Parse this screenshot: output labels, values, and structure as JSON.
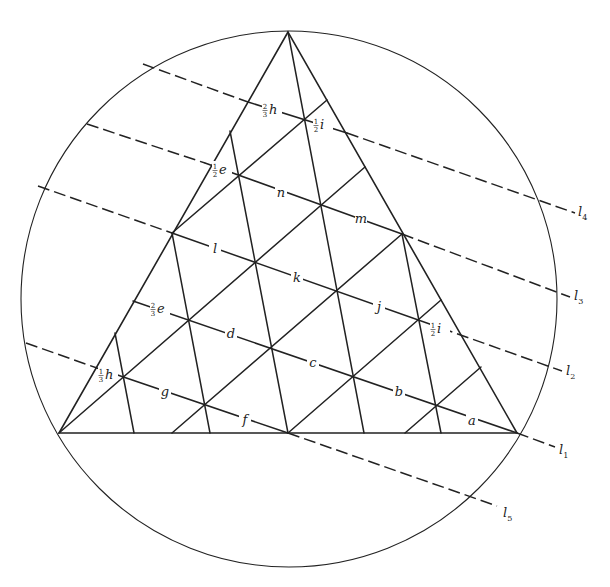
{
  "figure": {
    "stroke_color": "#222222",
    "background": "#ffffff",
    "circle": {
      "cx": 289,
      "cy": 299,
      "r": 268
    },
    "triangle": {
      "vertices": [
        [
          288,
          32
        ],
        [
          59,
          433
        ],
        [
          517,
          433
        ]
      ]
    },
    "parallel_lines": [
      {
        "name": "l4",
        "label": "l",
        "subscript": "4",
        "label_pos": [
          578,
          216
        ],
        "dashed": [
          [
            [
              143,
              64
            ],
            [
              248,
              102
            ]
          ],
          [
            [
              347,
              133
            ],
            [
              575,
              213
            ]
          ]
        ],
        "solid": [
          [
            [
              248,
              102
            ],
            [
              347,
              133
            ]
          ]
        ]
      },
      {
        "name": "l3",
        "label": "l",
        "subscript": "3",
        "label_pos": [
          574,
          300
        ],
        "dashed": [
          [
            [
              87,
              124
            ],
            [
              205,
              163
            ]
          ],
          [
            [
              402,
              234
            ],
            [
              570,
              297
            ]
          ]
        ],
        "solid": [
          [
            [
              205,
              163
            ],
            [
              402,
              234
            ]
          ]
        ]
      },
      {
        "name": "l2",
        "label": "l",
        "subscript": "2",
        "label_pos": [
          566,
          375
        ],
        "dashed": [
          [
            [
              38,
              186
            ],
            [
              172,
              233
            ]
          ],
          [
            [
              441,
              328
            ],
            [
              562,
              371
            ]
          ]
        ],
        "solid": [
          [
            [
              172,
              233
            ],
            [
              441,
              328
            ]
          ]
        ]
      },
      {
        "name": "l1",
        "label": "l",
        "subscript": "1",
        "label_pos": [
          559,
          454
        ],
        "dashed": [
          [
            [
              517,
              433
            ],
            [
              555,
              447
            ]
          ]
        ],
        "solid": [
          [
            [
              133,
              301
            ],
            [
              517,
              433
            ]
          ]
        ]
      },
      {
        "name": "l5",
        "label": "l",
        "subscript": "5",
        "label_pos": [
          503,
          517
        ],
        "dashed": [
          [
            [
              26,
              343
            ],
            [
              97,
              368
            ]
          ],
          [
            [
              288,
              433
            ],
            [
              497,
              506
            ]
          ]
        ],
        "solid": [
          [
            [
              97,
              368
            ],
            [
              288,
              433
            ]
          ]
        ]
      }
    ],
    "grid_lines": [
      [
        [
          59,
          433
        ],
        [
          365,
          167
        ]
      ],
      [
        [
          172,
          233
        ],
        [
          327,
          100
        ]
      ],
      [
        [
          172,
          433
        ],
        [
          402,
          234
        ]
      ],
      [
        [
          288,
          433
        ],
        [
          441,
          300
        ]
      ],
      [
        [
          405,
          433
        ],
        [
          481,
          367
        ]
      ],
      [
        [
          288,
          32
        ],
        [
          364,
          433
        ]
      ],
      [
        [
          230,
          131
        ],
        [
          288,
          433
        ]
      ],
      [
        [
          172,
          233
        ],
        [
          210,
          433
        ]
      ],
      [
        [
          115,
          333
        ],
        [
          134,
          433
        ]
      ],
      [
        [
          402,
          234
        ],
        [
          441,
          433
        ]
      ]
    ],
    "segment_labels": [
      {
        "text": "h",
        "coef_num": "2",
        "coef_den": "3",
        "pos": [
          272,
          112
        ]
      },
      {
        "text": "i",
        "coef_num": "1",
        "coef_den": "2",
        "pos": [
          323,
          127
        ]
      },
      {
        "text": "e",
        "coef_num": "1",
        "coef_den": "2",
        "pos": [
          222,
          172
        ]
      },
      {
        "text": "n",
        "coef_num": "",
        "coef_den": "",
        "pos": [
          281,
          195
        ]
      },
      {
        "text": "m",
        "coef_num": "",
        "coef_den": "",
        "pos": [
          361,
          221
        ]
      },
      {
        "text": "l",
        "coef_num": "",
        "coef_den": "",
        "pos": [
          215,
          251
        ]
      },
      {
        "text": "k",
        "coef_num": "",
        "coef_den": "",
        "pos": [
          297,
          280
        ]
      },
      {
        "text": "j",
        "coef_num": "",
        "coef_den": "",
        "pos": [
          379,
          309
        ]
      },
      {
        "text": "i",
        "coef_num": "1",
        "coef_den": "2",
        "pos": [
          440,
          331
        ]
      },
      {
        "text": "e",
        "coef_num": "2",
        "coef_den": "3",
        "pos": [
          160,
          311
        ]
      },
      {
        "text": "d",
        "coef_num": "",
        "coef_den": "",
        "pos": [
          231,
          336
        ]
      },
      {
        "text": "c",
        "coef_num": "",
        "coef_den": "",
        "pos": [
          313,
          365
        ]
      },
      {
        "text": "b",
        "coef_num": "",
        "coef_den": "",
        "pos": [
          399,
          394
        ]
      },
      {
        "text": "a",
        "coef_num": "",
        "coef_den": "",
        "pos": [
          472,
          423
        ]
      },
      {
        "text": "h",
        "coef_num": "1",
        "coef_den": "3",
        "pos": [
          108,
          377
        ]
      },
      {
        "text": "g",
        "coef_num": "",
        "coef_den": "",
        "pos": [
          165,
          394
        ]
      },
      {
        "text": "f",
        "coef_num": "",
        "coef_den": "",
        "pos": [
          245,
          422
        ]
      }
    ]
  }
}
